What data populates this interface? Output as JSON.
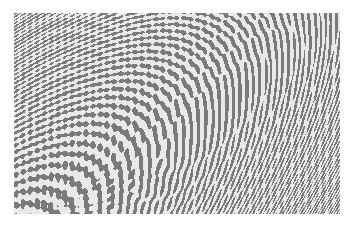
{
  "image": {
    "description": "Grayscale moire interference pattern with hyperbolic and swirling fringes",
    "background": "#ffffff",
    "ink": "#7a7a7a",
    "paper": "#e9e9e9",
    "bounds": {
      "x": 14,
      "y": 13,
      "width": 326,
      "height": 201
    },
    "centers": [
      {
        "x": 0.3,
        "y": 0.5,
        "freq": 0.55
      },
      {
        "x": 0.62,
        "y": 0.42,
        "freq": 0.5
      },
      {
        "x": 0.18,
        "y": 0.62,
        "freq": 0.65
      }
    ]
  }
}
